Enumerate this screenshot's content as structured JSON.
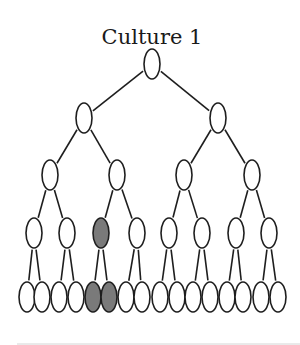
{
  "title": "Culture 1",
  "colors": {
    "node_fill": "#ffffff",
    "highlight_fill": "#7a7a7a",
    "stroke": "#1e1e1e"
  },
  "tree": {
    "levels": [
      {
        "y": 64,
        "xs": [
          152
        ]
      },
      {
        "y": 118,
        "xs": [
          84,
          218
        ]
      },
      {
        "y": 175,
        "xs": [
          50,
          117,
          184,
          252
        ]
      },
      {
        "y": 233,
        "xs": [
          34,
          67,
          101,
          137,
          169,
          202,
          236,
          269
        ]
      },
      {
        "y": 297,
        "xs": [
          27,
          42,
          59,
          76,
          93,
          109,
          126,
          142,
          160,
          177,
          193,
          210,
          227,
          243,
          261,
          278
        ]
      }
    ],
    "node_rx": 8,
    "node_ry": 15,
    "highlighted": [
      {
        "level": 3,
        "index": 2
      },
      {
        "level": 4,
        "index": 4
      },
      {
        "level": 4,
        "index": 5
      }
    ]
  }
}
